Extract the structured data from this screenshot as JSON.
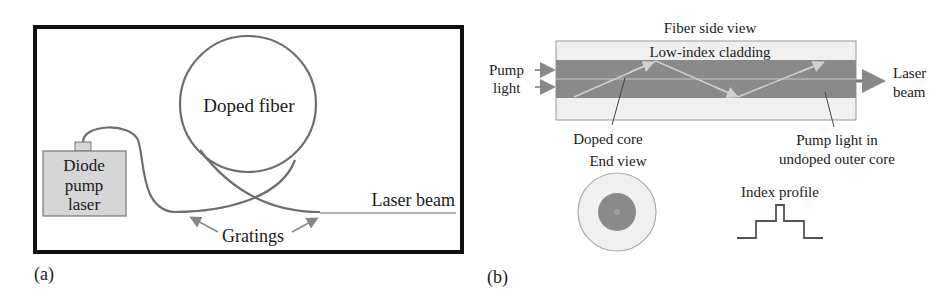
{
  "panel_a": {
    "label": "(a)",
    "diode_box": {
      "line1": "Diode",
      "line2": "pump",
      "line3": "laser"
    },
    "doped_fiber": "Doped fiber",
    "laser_beam": "Laser beam",
    "gratings": "Gratings"
  },
  "panel_b": {
    "label": "(b)",
    "side_view_title": "Fiber side view",
    "cladding_label": "Low-index cladding",
    "pump_light": {
      "line1": "Pump",
      "line2": "light"
    },
    "laser_beam": {
      "line1": "Laser",
      "line2": "beam"
    },
    "doped_core": "Doped core",
    "pump_outer": {
      "line1": "Pump light in",
      "line2": "undoped outer core"
    },
    "end_view": "End view",
    "index_profile": "Index profile"
  },
  "colors": {
    "frame": "#111111",
    "fiber": "#6e6e6e",
    "diode_fill": "#d6d6d6",
    "cladding_fill": "#f0f0f0",
    "core_fill": "#8a8a8a",
    "ray": "#c8c8c8",
    "arrow": "#888888"
  }
}
